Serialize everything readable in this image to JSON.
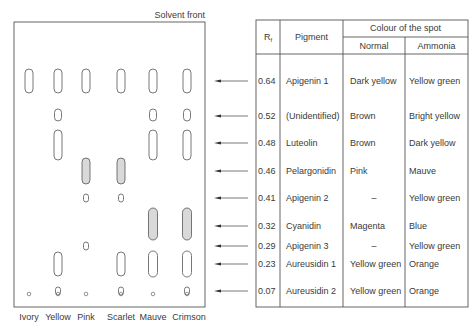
{
  "diagram": {
    "type": "paper-chromatogram",
    "solvent_front_label": "Solvent front",
    "lanes": [
      {
        "name": "Ivory"
      },
      {
        "name": "Yellow"
      },
      {
        "name": "Pink"
      },
      {
        "name": "Scarlet"
      },
      {
        "name": "Mauve"
      },
      {
        "name": "Crimson"
      }
    ],
    "spots": [
      {
        "lane": 0,
        "rf": 0.64,
        "shaded": false
      },
      {
        "lane": 1,
        "rf": 0.64,
        "shaded": false
      },
      {
        "lane": 2,
        "rf": 0.64,
        "shaded": false
      },
      {
        "lane": 3,
        "rf": 0.64,
        "shaded": false
      },
      {
        "lane": 4,
        "rf": 0.64,
        "shaded": false
      },
      {
        "lane": 5,
        "rf": 0.64,
        "shaded": false
      },
      {
        "lane": 1,
        "rf": 0.52,
        "shaded": false,
        "kind": "cap"
      },
      {
        "lane": 4,
        "rf": 0.52,
        "shaded": false,
        "kind": "cap"
      },
      {
        "lane": 5,
        "rf": 0.52,
        "shaded": false,
        "kind": "cap"
      },
      {
        "lane": 1,
        "rf": 0.48,
        "shaded": false,
        "kind": "long"
      },
      {
        "lane": 4,
        "rf": 0.48,
        "shaded": false,
        "kind": "long"
      },
      {
        "lane": 5,
        "rf": 0.48,
        "shaded": false,
        "kind": "long"
      },
      {
        "lane": 2,
        "rf": 0.46,
        "shaded": true
      },
      {
        "lane": 3,
        "rf": 0.46,
        "shaded": true
      },
      {
        "lane": 2,
        "rf": 0.41,
        "shaded": false,
        "kind": "small"
      },
      {
        "lane": 3,
        "rf": 0.41,
        "shaded": false,
        "kind": "small"
      },
      {
        "lane": 4,
        "rf": 0.32,
        "shaded": true
      },
      {
        "lane": 5,
        "rf": 0.32,
        "shaded": true
      },
      {
        "lane": 2,
        "rf": 0.29,
        "shaded": false,
        "kind": "small"
      },
      {
        "lane": 1,
        "rf": 0.23,
        "shaded": false
      },
      {
        "lane": 3,
        "rf": 0.23,
        "shaded": false
      },
      {
        "lane": 4,
        "rf": 0.23,
        "shaded": false
      },
      {
        "lane": 5,
        "rf": 0.23,
        "shaded": false
      },
      {
        "lane": 1,
        "rf": 0.07,
        "shaded": false,
        "kind": "small"
      },
      {
        "lane": 3,
        "rf": 0.07,
        "shaded": false,
        "kind": "small"
      },
      {
        "lane": 5,
        "rf": 0.07,
        "shaded": false,
        "kind": "small"
      }
    ]
  },
  "table": {
    "headers": {
      "rf": "R",
      "rf_sub": "f",
      "pigment": "Pigment",
      "colour_group": "Colour of the spot",
      "normal": "Normal",
      "ammonia": "Ammonia"
    },
    "rows": [
      {
        "rf": "0.64",
        "pigment": "Apigenin 1",
        "normal": "Dark yellow",
        "ammonia": "Yellow green"
      },
      {
        "rf": "0.52",
        "pigment": "(Unidentified)",
        "normal": "Brown",
        "ammonia": "Bright yellow"
      },
      {
        "rf": "0.48",
        "pigment": "Luteolin",
        "normal": "Brown",
        "ammonia": "Dark yellow"
      },
      {
        "rf": "0.46",
        "pigment": "Pelargonidin",
        "normal": "Pink",
        "ammonia": "Mauve"
      },
      {
        "rf": "0.41",
        "pigment": "Apigenin 2",
        "normal": "–",
        "ammonia": "Yellow green"
      },
      {
        "rf": "0.32",
        "pigment": "Cyanidin",
        "normal": "Magenta",
        "ammonia": "Blue"
      },
      {
        "rf": "0.29",
        "pigment": "Apigenin 3",
        "normal": "–",
        "ammonia": "Yellow green"
      },
      {
        "rf": "0.23",
        "pigment": "Aureusidin 1",
        "normal": "Yellow green",
        "ammonia": "Orange"
      },
      {
        "rf": "0.07",
        "pigment": "Aureusidin 2",
        "normal": "Yellow green",
        "ammonia": "Orange"
      }
    ]
  },
  "colors": {
    "line": "#555555",
    "spot_fill": "#d9d9d9",
    "text": "#3a3a3a"
  }
}
